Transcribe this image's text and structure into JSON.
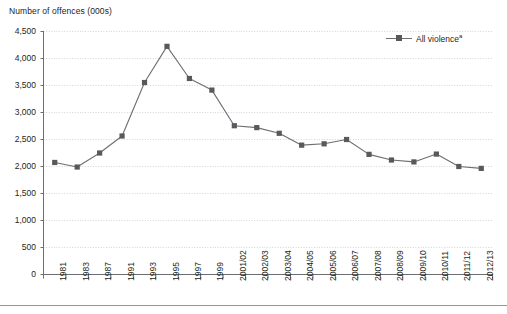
{
  "chart_data": {
    "type": "line",
    "title": "",
    "ylabel": "Number of offences (000s)",
    "xlabel": "",
    "ylim": [
      0,
      4500
    ],
    "ytick_step": 500,
    "grid": true,
    "legend_position": "top-right",
    "categories": [
      "1981",
      "1983",
      "1987",
      "1991",
      "1993",
      "1995",
      "1997",
      "1999",
      "2001/02",
      "2002/03",
      "2003/04",
      "2004/05",
      "2005/06",
      "2006/07",
      "2007/08",
      "2008/09",
      "2009/10",
      "2010/11",
      "2011/12",
      "2012/13"
    ],
    "ytick_labels": [
      "0",
      "500",
      "1,000",
      "1,500",
      "2,000",
      "2,500",
      "3,000",
      "3,500",
      "4,000",
      "4,500"
    ],
    "ytick_values": [
      0,
      500,
      1000,
      1500,
      2000,
      2500,
      3000,
      3500,
      4000,
      4500
    ],
    "series": [
      {
        "name": "All violence",
        "name_superscript": "a",
        "color": "#58595b",
        "line_color": "#6d6e71",
        "marker": "square",
        "values": [
          2075,
          1990,
          2250,
          2565,
          3555,
          4225,
          3630,
          3415,
          2755,
          2720,
          2615,
          2395,
          2420,
          2500,
          2225,
          2120,
          2085,
          2230,
          2000,
          1965
        ]
      }
    ]
  },
  "legend": {
    "label": "All violence",
    "superscript": "a"
  },
  "axis_title": "Number of offences (000s)"
}
